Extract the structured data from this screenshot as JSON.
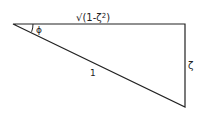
{
  "diagram": {
    "type": "right-triangle",
    "labels": {
      "top_side": "√(1-ζ²)",
      "top_side_sqrt": "√",
      "top_side_body": "(1-ζ",
      "top_side_exp": "2",
      "top_side_close": ")",
      "angle": "ϕ",
      "hypotenuse": "1",
      "right_side": "ζ"
    },
    "colors": {
      "stroke": "#222222",
      "background": "#ffffff"
    }
  }
}
